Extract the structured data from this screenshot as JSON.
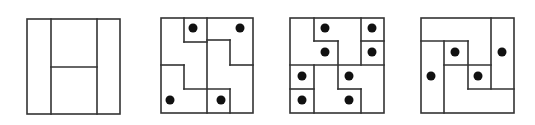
{
  "figure": {
    "width": 535,
    "height": 125,
    "line_color": "#333333",
    "line_width": 1.6,
    "dot_color": "#111111",
    "dot_radius": 4.5,
    "background": "#ffffff"
  },
  "panels": [
    {
      "id": "panel-1",
      "box": [
        27,
        19,
        120,
        114
      ],
      "segments": [
        [
          51,
          19,
          51,
          114
        ],
        [
          97,
          19,
          97,
          114
        ],
        [
          51,
          67,
          97,
          67
        ]
      ],
      "dots": []
    },
    {
      "id": "panel-2",
      "box": [
        161,
        18,
        253,
        113
      ],
      "segments": [
        [
          207,
          18,
          207,
          113
        ],
        [
          184,
          18,
          184,
          42
        ],
        [
          184,
          42,
          207,
          42
        ],
        [
          207,
          40,
          230,
          40
        ],
        [
          230,
          40,
          230,
          65
        ],
        [
          230,
          65,
          253,
          65
        ],
        [
          161,
          65,
          184,
          65
        ],
        [
          184,
          65,
          184,
          89
        ],
        [
          184,
          89,
          230,
          89
        ],
        [
          230,
          89,
          230,
          113
        ]
      ],
      "dots": [
        [
          193,
          28
        ],
        [
          240,
          28
        ],
        [
          170,
          100
        ],
        [
          221,
          100
        ]
      ]
    },
    {
      "id": "panel-3",
      "box": [
        290,
        18,
        384,
        113
      ],
      "segments": [
        [
          314,
          18,
          314,
          41
        ],
        [
          314,
          41,
          338,
          41
        ],
        [
          338,
          41,
          338,
          89
        ],
        [
          338,
          89,
          361,
          89
        ],
        [
          361,
          89,
          361,
          113
        ],
        [
          361,
          18,
          361,
          65
        ],
        [
          361,
          41,
          384,
          41
        ],
        [
          290,
          65,
          384,
          65
        ],
        [
          314,
          65,
          314,
          113
        ],
        [
          290,
          89,
          314,
          89
        ]
      ],
      "dots": [
        [
          325,
          28
        ],
        [
          372,
          28
        ],
        [
          325,
          52
        ],
        [
          372,
          52
        ],
        [
          302,
          76
        ],
        [
          349,
          76
        ],
        [
          302,
          100
        ],
        [
          349,
          100
        ]
      ]
    },
    {
      "id": "panel-4",
      "box": [
        421,
        18,
        514,
        113
      ],
      "segments": [
        [
          491,
          18,
          491,
          89
        ],
        [
          421,
          41,
          468,
          41
        ],
        [
          444,
          41,
          444,
          113
        ],
        [
          468,
          41,
          468,
          89
        ],
        [
          444,
          65,
          491,
          65
        ],
        [
          468,
          89,
          514,
          89
        ]
      ],
      "dots": [
        [
          455,
          52
        ],
        [
          502,
          52
        ],
        [
          431,
          76
        ],
        [
          478,
          76
        ]
      ]
    }
  ]
}
